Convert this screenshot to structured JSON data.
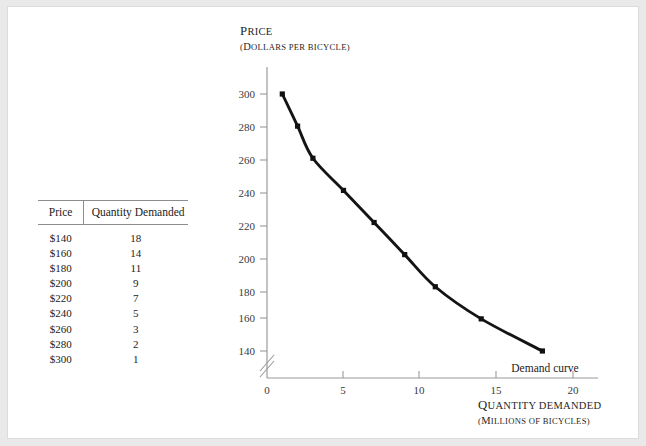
{
  "figure": {
    "page_background": "#e9e9e9",
    "canvas_background": "#ffffff"
  },
  "table": {
    "headers": [
      "Price",
      "Quantity Demanded"
    ],
    "rows": [
      [
        "$140",
        "18"
      ],
      [
        "$160",
        "14"
      ],
      [
        "$180",
        "11"
      ],
      [
        "$200",
        "9"
      ],
      [
        "$220",
        "7"
      ],
      [
        "$240",
        "5"
      ],
      [
        "$260",
        "3"
      ],
      [
        "$280",
        "2"
      ],
      [
        "$300",
        "1"
      ]
    ]
  },
  "chart_data": {
    "type": "line",
    "title": "",
    "ylabel_line1": "Price",
    "ylabel_line2": "(Dollars per bicycle)",
    "xlabel_line1": "Quantity demanded",
    "xlabel_line2": "(Millions of bicycles)",
    "x": [
      1,
      2,
      3,
      5,
      7,
      9,
      11,
      14,
      18
    ],
    "y": [
      300,
      280,
      260,
      240,
      220,
      200,
      180,
      160,
      140
    ],
    "series": [
      {
        "name": "Demand curve",
        "x": [
          1,
          2,
          3,
          5,
          7,
          9,
          11,
          14,
          18
        ],
        "values": [
          300,
          280,
          260,
          240,
          220,
          200,
          180,
          160,
          140
        ]
      }
    ],
    "annotations": [
      "Demand curve"
    ],
    "xlim": [
      0,
      20
    ],
    "ylim": [
      140,
      300
    ],
    "y_axis_break": true,
    "y_ticks": [
      "140",
      "160",
      "180",
      "200",
      "220",
      "240",
      "260",
      "280",
      "300"
    ],
    "x_ticks": [
      "0",
      "5",
      "10",
      "15",
      "20"
    ],
    "grid": false,
    "legend": "none",
    "curve_color": "#111111",
    "marker_shape": "square",
    "axis_color": "#9a9a9a"
  },
  "labels": {
    "demand_curve": "Demand curve",
    "y_tick_300": "300",
    "y_tick_280": "280",
    "y_tick_260": "260",
    "y_tick_240": "240",
    "y_tick_220": "220",
    "y_tick_200": "200",
    "y_tick_180": "180",
    "y_tick_160": "160",
    "y_tick_140": "140",
    "x_tick_0": "0",
    "x_tick_5": "5",
    "x_tick_10": "10",
    "x_tick_15": "15",
    "x_tick_20": "20"
  }
}
